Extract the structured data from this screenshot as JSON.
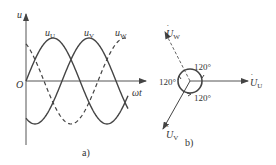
{
  "figure_a": {
    "caption": "a)",
    "y_axis_label": "u",
    "x_axis_label": "ωt",
    "origin_label": "O",
    "curves": [
      {
        "name": "u",
        "subscript": "U",
        "style": "solid",
        "phase_deg": 0
      },
      {
        "name": "u",
        "subscript": "V",
        "style": "solid",
        "phase_deg": -120
      },
      {
        "name": "u",
        "subscript": "W",
        "style": "dashed",
        "phase_deg": 120
      }
    ]
  },
  "figure_b": {
    "caption": "b)",
    "phasors": [
      {
        "name": "U",
        "subscript": "U",
        "angle_deg": 0,
        "style": "solid"
      },
      {
        "name": "U",
        "subscript": "V",
        "angle_deg": -120,
        "style": "solid"
      },
      {
        "name": "U",
        "subscript": "W",
        "angle_deg": 120,
        "style": "dashed"
      }
    ],
    "angle_labels": [
      "120°",
      "120°",
      "120°"
    ]
  },
  "colors": {
    "stroke": "#444444",
    "text": "#333333"
  }
}
